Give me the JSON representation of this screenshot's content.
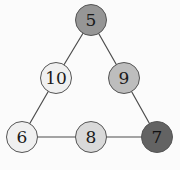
{
  "diagram": {
    "background_color": "#fbfbfb",
    "edge_color": "#4d4d4d",
    "edge_width": 1.2,
    "node_border_color": "#555555",
    "default_label_color": "#1a1a1a",
    "nodes": [
      {
        "id": "n5",
        "label": "5",
        "cx": 91,
        "cy": 20,
        "r": 16,
        "fill": "#969696",
        "label_color": "#1a1a1a",
        "font_size": 17
      },
      {
        "id": "n10",
        "label": "10",
        "cx": 56,
        "cy": 78,
        "r": 16,
        "fill": "#f0f0f0",
        "label_color": "#1a1a1a",
        "font_size": 17
      },
      {
        "id": "n9",
        "label": "9",
        "cx": 124,
        "cy": 78,
        "r": 16,
        "fill": "#bdbdbd",
        "label_color": "#1a1a1a",
        "font_size": 17
      },
      {
        "id": "n6",
        "label": "6",
        "cx": 22,
        "cy": 137,
        "r": 16,
        "fill": "#f0f0f0",
        "label_color": "#1a1a1a",
        "font_size": 17
      },
      {
        "id": "n8",
        "label": "8",
        "cx": 91,
        "cy": 137,
        "r": 16,
        "fill": "#d9d9d9",
        "label_color": "#1a1a1a",
        "font_size": 17
      },
      {
        "id": "n7",
        "label": "7",
        "cx": 157,
        "cy": 137,
        "r": 16,
        "fill": "#636363",
        "label_color": "#111111",
        "font_size": 17
      }
    ],
    "edges": [
      {
        "id": "e5-10",
        "source": "n5",
        "target": "n10",
        "x1": 91,
        "y1": 20,
        "x2": 56,
        "y2": 78
      },
      {
        "id": "e5-9",
        "source": "n5",
        "target": "n9",
        "x1": 91,
        "y1": 20,
        "x2": 124,
        "y2": 78
      },
      {
        "id": "e10-6",
        "source": "n10",
        "target": "n6",
        "x1": 56,
        "y1": 78,
        "x2": 22,
        "y2": 137
      },
      {
        "id": "e9-7",
        "source": "n9",
        "target": "n7",
        "x1": 124,
        "y1": 78,
        "x2": 157,
        "y2": 137
      },
      {
        "id": "e6-8",
        "source": "n6",
        "target": "n8",
        "x1": 22,
        "y1": 137,
        "x2": 91,
        "y2": 137
      },
      {
        "id": "e8-7",
        "source": "n8",
        "target": "n7",
        "x1": 91,
        "y1": 137,
        "x2": 157,
        "y2": 137
      }
    ]
  }
}
